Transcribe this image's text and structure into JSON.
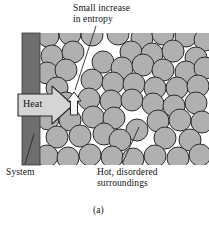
{
  "figure": {
    "caption": "(a)",
    "labels": {
      "entropy_line1": "Small increase",
      "entropy_line2": "in entropy",
      "system": "System",
      "surroundings_line1": "Hot, disordered",
      "surroundings_line2": "surroundings",
      "heat": "Heat"
    },
    "colors": {
      "wall_fill": "#6e6e6e",
      "particle_fill": "#b0b0b0",
      "particle_stroke": "#2b2b2b",
      "heat_arrow_fill": "#d5d5d5",
      "heat_arrow_stroke": "#2b2b2b",
      "entropy_arrow_fill": "#f7f7f7",
      "entropy_arrow_stroke": "#2b2b2b",
      "leader_line": "#2b2b2b",
      "background": "#ffffff",
      "text": "#111111"
    }
  },
  "chart_data": {
    "type": "diagram",
    "title": "(a)",
    "annotations": [
      {
        "name": "small-increase-in-entropy",
        "text": "Small increase in entropy",
        "anchor_x": 74,
        "anchor_y": 97
      },
      {
        "name": "system",
        "text": "System",
        "anchor_x": 32,
        "anchor_y": 130
      },
      {
        "name": "hot-disordered-surroundings",
        "text": "Hot, disordered surroundings",
        "anchor_x": 137,
        "anchor_y": 130
      },
      {
        "name": "heat",
        "text": "Heat",
        "anchor_x": 45,
        "anchor_y": 103
      }
    ],
    "frame": {
      "x": 20,
      "y": 33,
      "width": 189,
      "height": 132
    },
    "wall": {
      "x": 22,
      "y": 33,
      "width": 18,
      "height": 132
    },
    "heat_arrow": {
      "direction": "right",
      "x": 18,
      "y": 92,
      "width": 55,
      "height": 26
    },
    "entropy_arrow": {
      "direction": "up",
      "x": 68,
      "y": 93,
      "width": 12,
      "height": 22
    },
    "particle_radius": 11,
    "particles": [
      {
        "x": 48,
        "y": 36
      },
      {
        "x": 70,
        "y": 34
      },
      {
        "x": 92,
        "y": 35
      },
      {
        "x": 118,
        "y": 34
      },
      {
        "x": 142,
        "y": 38
      },
      {
        "x": 163,
        "y": 34
      },
      {
        "x": 186,
        "y": 36
      },
      {
        "x": 205,
        "y": 40
      },
      {
        "x": 52,
        "y": 56
      },
      {
        "x": 73,
        "y": 52
      },
      {
        "x": 131,
        "y": 52
      },
      {
        "x": 152,
        "y": 54
      },
      {
        "x": 173,
        "y": 51
      },
      {
        "x": 196,
        "y": 58
      },
      {
        "x": 47,
        "y": 73
      },
      {
        "x": 66,
        "y": 70
      },
      {
        "x": 103,
        "y": 62
      },
      {
        "x": 122,
        "y": 68
      },
      {
        "x": 143,
        "y": 65
      },
      {
        "x": 163,
        "y": 70
      },
      {
        "x": 186,
        "y": 72
      },
      {
        "x": 205,
        "y": 68
      },
      {
        "x": 57,
        "y": 88
      },
      {
        "x": 92,
        "y": 80
      },
      {
        "x": 113,
        "y": 83
      },
      {
        "x": 134,
        "y": 84
      },
      {
        "x": 155,
        "y": 88
      },
      {
        "x": 177,
        "y": 88
      },
      {
        "x": 198,
        "y": 86
      },
      {
        "x": 66,
        "y": 103
      },
      {
        "x": 89,
        "y": 99
      },
      {
        "x": 111,
        "y": 101
      },
      {
        "x": 132,
        "y": 100
      },
      {
        "x": 153,
        "y": 104
      },
      {
        "x": 174,
        "y": 106
      },
      {
        "x": 196,
        "y": 103
      },
      {
        "x": 48,
        "y": 119
      },
      {
        "x": 70,
        "y": 120
      },
      {
        "x": 93,
        "y": 117
      },
      {
        "x": 114,
        "y": 118
      },
      {
        "x": 137,
        "y": 130
      },
      {
        "x": 158,
        "y": 121
      },
      {
        "x": 180,
        "y": 120
      },
      {
        "x": 202,
        "y": 122
      },
      {
        "x": 57,
        "y": 137
      },
      {
        "x": 80,
        "y": 136
      },
      {
        "x": 104,
        "y": 134
      },
      {
        "x": 120,
        "y": 140
      },
      {
        "x": 165,
        "y": 138
      },
      {
        "x": 190,
        "y": 140
      },
      {
        "x": 47,
        "y": 156
      },
      {
        "x": 68,
        "y": 158
      },
      {
        "x": 90,
        "y": 155
      },
      {
        "x": 112,
        "y": 157
      },
      {
        "x": 133,
        "y": 159
      },
      {
        "x": 155,
        "y": 156
      },
      {
        "x": 178,
        "y": 158
      },
      {
        "x": 200,
        "y": 155
      }
    ]
  }
}
